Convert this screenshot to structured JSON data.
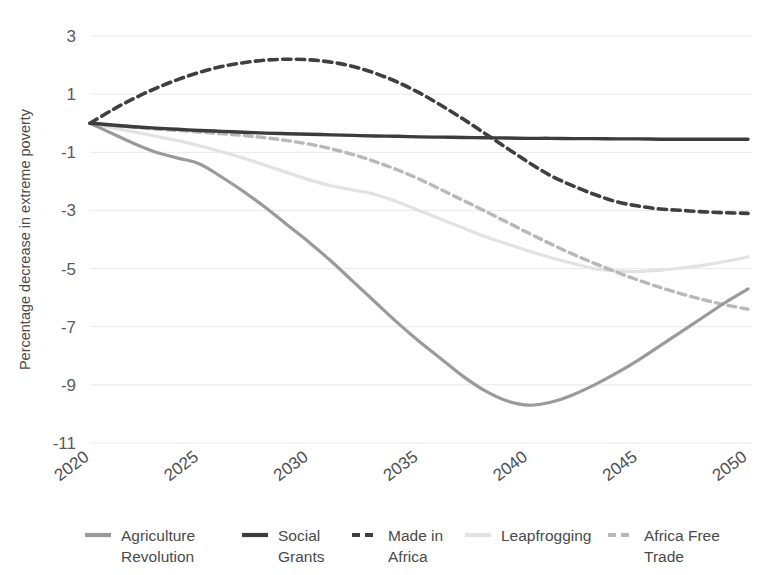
{
  "chart_data": {
    "type": "line",
    "title": "",
    "xlabel": "",
    "ylabel": "Percentage decrease in extreme poverty",
    "x": [
      2020,
      2021,
      2022,
      2023,
      2024,
      2025,
      2026,
      2027,
      2028,
      2029,
      2030,
      2031,
      2032,
      2033,
      2034,
      2035,
      2036,
      2037,
      2038,
      2039,
      2040,
      2041,
      2042,
      2043,
      2044,
      2045,
      2046,
      2047,
      2048,
      2049,
      2050
    ],
    "xlim": [
      2020,
      2050
    ],
    "ylim": [
      -11,
      3
    ],
    "yticks": [
      3,
      1,
      -1,
      -3,
      -5,
      -7,
      -9,
      -11
    ],
    "ytick_labels": [
      "3",
      "1",
      "-1",
      "-3",
      "-5",
      "-7",
      "-9",
      "-11"
    ],
    "xticks": [
      2020,
      2025,
      2030,
      2035,
      2040,
      2045,
      2050
    ],
    "xtick_labels": [
      "2020",
      "2025",
      "2030",
      "2035",
      "2040",
      "2045",
      "2050"
    ],
    "grid": "horizontal",
    "legend_position": "bottom",
    "series": [
      {
        "name": "Agriculture Revolution",
        "color": "#9a9a9a",
        "style": "solid",
        "width": 3.2,
        "values": [
          0.0,
          -0.35,
          -0.7,
          -1.0,
          -1.2,
          -1.4,
          -1.85,
          -2.35,
          -2.9,
          -3.5,
          -4.1,
          -4.75,
          -5.45,
          -6.15,
          -6.85,
          -7.5,
          -8.1,
          -8.7,
          -9.2,
          -9.55,
          -9.7,
          -9.6,
          -9.35,
          -9.0,
          -8.6,
          -8.15,
          -7.65,
          -7.15,
          -6.65,
          -6.15,
          -5.7
        ]
      },
      {
        "name": "Social Grants",
        "color": "#3c3c3c",
        "style": "solid",
        "width": 3.4,
        "values": [
          0.0,
          -0.06,
          -0.12,
          -0.17,
          -0.21,
          -0.25,
          -0.28,
          -0.31,
          -0.34,
          -0.36,
          -0.38,
          -0.4,
          -0.42,
          -0.44,
          -0.45,
          -0.47,
          -0.48,
          -0.49,
          -0.5,
          -0.51,
          -0.52,
          -0.52,
          -0.53,
          -0.53,
          -0.54,
          -0.54,
          -0.55,
          -0.55,
          -0.55,
          -0.55,
          -0.55
        ]
      },
      {
        "name": "Made in Africa",
        "color": "#3f3f3f",
        "style": "dashed",
        "width": 3.6,
        "values": [
          0.0,
          0.45,
          0.85,
          1.2,
          1.5,
          1.75,
          1.95,
          2.08,
          2.17,
          2.2,
          2.18,
          2.1,
          1.95,
          1.72,
          1.42,
          1.05,
          0.62,
          0.15,
          -0.35,
          -0.85,
          -1.35,
          -1.8,
          -2.15,
          -2.45,
          -2.7,
          -2.85,
          -2.95,
          -3.0,
          -3.05,
          -3.08,
          -3.1
        ]
      },
      {
        "name": "Leapfrogging",
        "color": "#e2e2e2",
        "style": "solid",
        "width": 3.2,
        "values": [
          0.0,
          -0.15,
          -0.3,
          -0.45,
          -0.6,
          -0.78,
          -0.98,
          -1.2,
          -1.45,
          -1.7,
          -1.95,
          -2.15,
          -2.3,
          -2.45,
          -2.7,
          -3.0,
          -3.3,
          -3.6,
          -3.9,
          -4.15,
          -4.4,
          -4.62,
          -4.82,
          -5.0,
          -5.08,
          -5.1,
          -5.05,
          -4.98,
          -4.88,
          -4.75,
          -4.6
        ]
      },
      {
        "name": "Africa Free Trade",
        "color": "#b8b8b8",
        "style": "dashed",
        "width": 3.4,
        "values": [
          0.0,
          -0.08,
          -0.14,
          -0.2,
          -0.25,
          -0.3,
          -0.36,
          -0.42,
          -0.5,
          -0.6,
          -0.72,
          -0.88,
          -1.08,
          -1.32,
          -1.6,
          -1.92,
          -2.28,
          -2.65,
          -3.02,
          -3.4,
          -3.78,
          -4.15,
          -4.5,
          -4.82,
          -5.12,
          -5.4,
          -5.65,
          -5.88,
          -6.08,
          -6.25,
          -6.4
        ]
      }
    ]
  },
  "legend": {
    "items": [
      {
        "label_line1": "Agriculture",
        "label_line2": "Revolution",
        "color": "#9a9a9a",
        "style": "solid"
      },
      {
        "label_line1": "Social",
        "label_line2": "Grants",
        "color": "#3c3c3c",
        "style": "solid"
      },
      {
        "label_line1": "Made in",
        "label_line2": "Africa",
        "color": "#3f3f3f",
        "style": "dashed"
      },
      {
        "label_line1": "Leapfrogging",
        "label_line2": "",
        "color": "#e2e2e2",
        "style": "solid"
      },
      {
        "label_line1": "Africa Free",
        "label_line2": "Trade",
        "color": "#b8b8b8",
        "style": "dashed"
      }
    ]
  }
}
